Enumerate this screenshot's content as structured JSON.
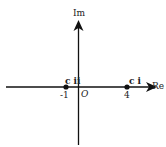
{
  "diagram": {
    "axes": {
      "vertical_label": "Im",
      "horizontal_label": "Re",
      "origin_label": "O"
    },
    "points": [
      {
        "name": "c ii",
        "value": "-1",
        "x_value": -1
      },
      {
        "name": "c i",
        "value": "4",
        "x_value": 4
      }
    ],
    "colors": {
      "line": "#111111",
      "text": "#222222"
    }
  }
}
